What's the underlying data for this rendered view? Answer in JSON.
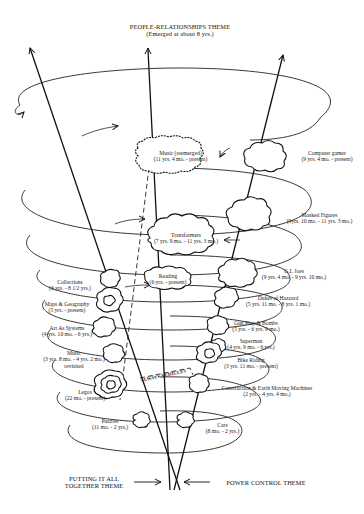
{
  "title": {
    "name": "PEOPLE-RELATIONSHIPS THEME",
    "subtitle": "(Emerged at about 8 yrs.)"
  },
  "bottom_themes": {
    "left": [
      "PUTTING IT ALL",
      "TOGETHER THEME"
    ],
    "right": "POWER CONTROL THEME"
  },
  "vehicles_label": "ALWAYS VEHICLES",
  "interests_right": [
    {
      "name": "Computer games",
      "dates": "(9 yrs. 4 mo. - present)"
    },
    {
      "name": "Masked Figures",
      "dates": "(9yrs. 10 mo. - 11 yrs. 3 mo.)"
    },
    {
      "name": "G.I. Joes",
      "dates": "(9 yrs. 4 mo. - 9 yrs. 10 mo.)"
    },
    {
      "name": "Dukes of Hazzard",
      "dates": "(5 yrs. 11 mo. - 8 yrs. 1 mo.)"
    },
    {
      "name": "Gun Play & Bombs",
      "dates": "(5 yrs. - 6 yrs. 9 mo.)"
    },
    {
      "name": "Superman",
      "dates": "(4 yrs. 9 mo. - 6 yrs.)"
    },
    {
      "name": "Bike Riding",
      "dates": "(3 yrs. 11 mo. - present)"
    },
    {
      "name": "Construction & Earth Moving Machines",
      "dates": "(2 yrs. - 4 yrs. 4 mo.)"
    },
    {
      "name": "Cars",
      "dates": "(8 mo. - 2 yrs.)"
    }
  ],
  "interests_left": [
    {
      "name": "Collections",
      "dates": "(6 yrs. - 8 1/2 yrs.)"
    },
    {
      "name": "Maps & Geography",
      "dates": "(5 yrs. - present)"
    },
    {
      "name": "Art As Systems",
      "dates": "(4 yrs. 10 mo. - 6 yrs.)"
    },
    {
      "name": "Music",
      "dates": "(3 yrs. 8 mo. - 4 yrs. 2 mo.)",
      "note": "revisited"
    },
    {
      "name": "Legos",
      "dates": "(22 mo. - present)"
    },
    {
      "name": "Puzzles",
      "dates": "(11 mo. - 2 yrs.)"
    }
  ],
  "interests_center": [
    {
      "name": "Music (reemerged)",
      "dates": "(11 yrs. 4 mo. - present)"
    },
    {
      "name": "Transformers",
      "dates": "(7 yrs. 9 mo. - 11 yrs. 3 mo.)"
    },
    {
      "name": "Reading",
      "dates": "(6 yrs. - present)"
    }
  ]
}
